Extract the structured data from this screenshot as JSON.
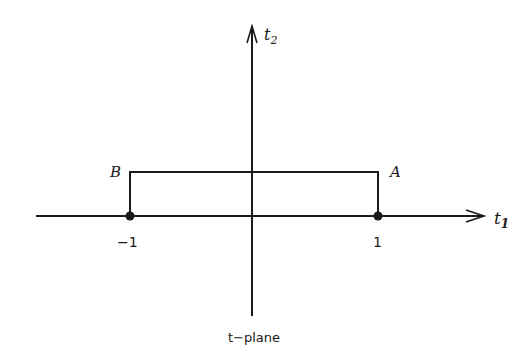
{
  "diagram": {
    "caption": "t−plane",
    "axes": {
      "horizontal_label": "t",
      "horizontal_subscript": "1",
      "vertical_label": "t",
      "vertical_subscript": "2"
    },
    "points": [
      {
        "name": "B",
        "tick_label": "−1"
      },
      {
        "name": "A",
        "tick_label": "1"
      }
    ],
    "colors": {
      "ink": "#1a1a1a",
      "background": "#ffffff"
    }
  }
}
